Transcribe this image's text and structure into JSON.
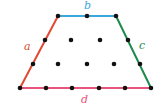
{
  "figure": {
    "type": "lattice-polygon-diagram",
    "shape": "trapezoid",
    "background_color": "#ffffff",
    "width": 166,
    "height": 112
  },
  "labels": {
    "a": "a",
    "b": "b",
    "c": "c",
    "d": "d"
  },
  "label_positions": {
    "a": {
      "x": 24,
      "y": 41
    },
    "b": {
      "x": 84,
      "y": 0
    },
    "c": {
      "x": 139,
      "y": 40
    },
    "d": {
      "x": 81,
      "y": 94
    }
  },
  "colors": {
    "side_a": "#e04a32",
    "side_b": "#3ba7dd",
    "side_c": "#1d8a4e",
    "side_d": "#e8547c",
    "dot": "#111111",
    "background": "#ffffff"
  },
  "vertices": {
    "bottom_left": {
      "x": 20,
      "y": 88
    },
    "top_left": {
      "x": 58,
      "y": 16
    },
    "top_right": {
      "x": 116,
      "y": 16
    },
    "bottom_right": {
      "x": 151,
      "y": 88
    }
  },
  "edges": [
    {
      "name": "a",
      "from": "bottom_left",
      "to": "top_left",
      "color": "#e04a32",
      "label": "a"
    },
    {
      "name": "b",
      "from": "top_left",
      "to": "top_right",
      "color": "#3ba7dd",
      "label": "b"
    },
    {
      "name": "c",
      "from": "top_right",
      "to": "bottom_right",
      "color": "#1d8a4e",
      "label": "c"
    },
    {
      "name": "d",
      "from": "bottom_right",
      "to": "bottom_left",
      "color": "#e8547c",
      "label": "d"
    }
  ],
  "lattice_points": {
    "boundary": [
      {
        "x": 20,
        "y": 88
      },
      {
        "x": 33,
        "y": 64
      },
      {
        "x": 45,
        "y": 40
      },
      {
        "x": 58,
        "y": 16
      },
      {
        "x": 87,
        "y": 16
      },
      {
        "x": 116,
        "y": 16
      },
      {
        "x": 128,
        "y": 40
      },
      {
        "x": 140,
        "y": 64
      },
      {
        "x": 151,
        "y": 88
      },
      {
        "x": 125,
        "y": 88
      },
      {
        "x": 99,
        "y": 88
      },
      {
        "x": 72,
        "y": 88
      },
      {
        "x": 46,
        "y": 88
      }
    ],
    "interior": [
      {
        "x": 71,
        "y": 40
      },
      {
        "x": 100,
        "y": 40
      },
      {
        "x": 58,
        "y": 64
      },
      {
        "x": 87,
        "y": 64
      },
      {
        "x": 114,
        "y": 64
      }
    ],
    "boundary_count": 13,
    "interior_count": 5
  },
  "stroke_width": 2,
  "dot_radius": 2.3
}
